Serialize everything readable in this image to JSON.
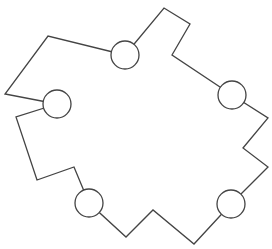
{
  "diagram": {
    "width": 272,
    "height": 249,
    "stroke_color": "#444444",
    "fill_color": "#ffffff",
    "stroke_width": 1.3,
    "outline_points": [
      [
        125,
        55
      ],
      [
        164,
        8
      ],
      [
        190,
        24
      ],
      [
        172,
        55
      ],
      [
        232,
        95
      ],
      [
        268,
        118
      ],
      [
        243,
        148
      ],
      [
        268,
        167
      ],
      [
        231,
        204
      ],
      [
        194,
        244
      ],
      [
        153,
        210
      ],
      [
        126,
        237
      ],
      [
        89,
        203
      ],
      [
        74,
        167
      ],
      [
        37,
        180
      ],
      [
        16,
        117
      ],
      [
        57,
        104
      ],
      [
        5,
        94
      ],
      [
        48,
        36
      ],
      [
        125,
        55
      ]
    ],
    "nodes": [
      {
        "id": "node-top",
        "cx": 125,
        "cy": 55,
        "r": 14
      },
      {
        "id": "node-right-upper",
        "cx": 232,
        "cy": 95,
        "r": 14
      },
      {
        "id": "node-right-lower",
        "cx": 231,
        "cy": 204,
        "r": 14
      },
      {
        "id": "node-bottom-left",
        "cx": 89,
        "cy": 203,
        "r": 14
      },
      {
        "id": "node-left",
        "cx": 57,
        "cy": 104,
        "r": 14
      }
    ]
  }
}
